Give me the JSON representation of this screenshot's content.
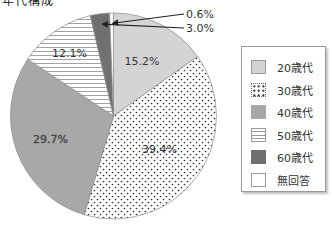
{
  "page": {
    "cropped_title_text": "年代構成"
  },
  "chart_data": {
    "type": "pie",
    "title": "",
    "start": "top",
    "direction": "clockwise",
    "legend_position": "right",
    "slices": [
      {
        "label": "20歳代",
        "value": 15.2,
        "display": "15.2%",
        "fill": "light-gray",
        "color": "#d4d4d4"
      },
      {
        "label": "30歳代",
        "value": 39.4,
        "display": "39.4%",
        "fill": "dots",
        "color": "#ffffff"
      },
      {
        "label": "40歳代",
        "value": 29.7,
        "display": "29.7%",
        "fill": "medium-gray",
        "color": "#a8a8a8"
      },
      {
        "label": "50歳代",
        "value": 12.1,
        "display": "12.1%",
        "fill": "horizontal-stripes",
        "color": "#ffffff"
      },
      {
        "label": "60歳代",
        "value": 3.0,
        "display": "3.0%",
        "fill": "dark-gray",
        "color": "#707070"
      },
      {
        "label": "無回答",
        "value": 0.6,
        "display": "0.6%",
        "fill": "white",
        "color": "#ffffff"
      }
    ],
    "legend": [
      "20歳代",
      "30歳代",
      "40歳代",
      "50歳代",
      "60歳代",
      "無回答"
    ],
    "callouts": [
      {
        "slice": "無回答",
        "text": "0.6%"
      },
      {
        "slice": "60歳代",
        "text": "3.0%"
      }
    ]
  }
}
